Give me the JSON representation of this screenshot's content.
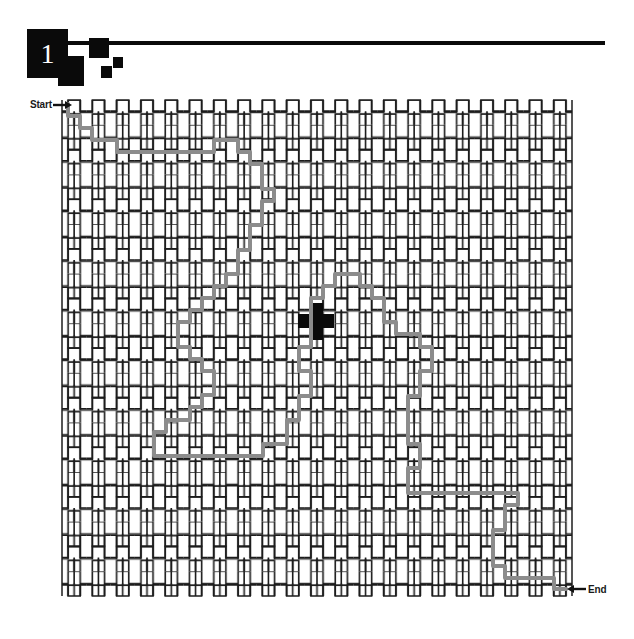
{
  "page": {
    "background_color": "#ffffff",
    "width": 634,
    "height": 639
  },
  "header": {
    "number": "1",
    "ink_color": "#0a0a0a",
    "rule_color": "#0a0a0a",
    "number_color": "#ffffff"
  },
  "maze": {
    "start_label": "Start",
    "end_label": "End",
    "wall_color": "#1c1c1c",
    "path_color": "#8c8c8c",
    "marker_color": "#0a0a0a",
    "marker_shape": "cross",
    "bounds": {
      "x": 62,
      "y": 100,
      "width": 510,
      "height": 496
    },
    "cell_pitch": 24.3,
    "columns": 21,
    "rows": 20,
    "start_point": {
      "x": 68,
      "y": 107
    },
    "end_point": {
      "x": 566,
      "y": 589
    },
    "marker_point": {
      "x": 316,
      "y": 321
    }
  },
  "icons": {
    "start_arrow": "arrow-right-icon",
    "end_arrow": "arrow-left-icon",
    "center_marker": "cross-marker-icon"
  },
  "solution_path": {
    "stroke_width": 4,
    "points": [
      [
        68,
        104
      ],
      [
        68,
        116
      ],
      [
        80,
        116
      ],
      [
        80,
        128
      ],
      [
        92,
        128
      ],
      [
        92,
        140
      ],
      [
        117,
        140
      ],
      [
        117,
        152
      ],
      [
        214,
        152
      ],
      [
        214,
        140
      ],
      [
        238,
        140
      ],
      [
        238,
        152
      ],
      [
        250,
        152
      ],
      [
        250,
        164
      ],
      [
        262,
        164
      ],
      [
        262,
        189
      ],
      [
        274,
        189
      ],
      [
        274,
        201
      ],
      [
        262,
        201
      ],
      [
        262,
        225
      ],
      [
        250,
        225
      ],
      [
        250,
        250
      ],
      [
        238,
        250
      ],
      [
        238,
        274
      ],
      [
        226,
        274
      ],
      [
        226,
        286
      ],
      [
        214,
        286
      ],
      [
        214,
        298
      ],
      [
        202,
        298
      ],
      [
        202,
        310
      ],
      [
        190,
        310
      ],
      [
        190,
        322
      ],
      [
        178,
        322
      ],
      [
        178,
        347
      ],
      [
        190,
        347
      ],
      [
        190,
        359
      ],
      [
        202,
        359
      ],
      [
        202,
        371
      ],
      [
        214,
        371
      ],
      [
        214,
        395
      ],
      [
        202,
        395
      ],
      [
        202,
        407
      ],
      [
        190,
        407
      ],
      [
        190,
        420
      ],
      [
        166,
        420
      ],
      [
        166,
        432
      ],
      [
        154,
        432
      ],
      [
        154,
        456
      ],
      [
        263,
        456
      ],
      [
        263,
        444
      ],
      [
        287,
        444
      ],
      [
        287,
        420
      ],
      [
        299,
        420
      ],
      [
        299,
        396
      ],
      [
        311,
        396
      ],
      [
        311,
        371
      ],
      [
        299,
        371
      ],
      [
        299,
        347
      ],
      [
        311,
        347
      ],
      [
        311,
        322
      ],
      [
        311,
        298
      ],
      [
        323,
        298
      ],
      [
        323,
        286
      ],
      [
        335,
        286
      ],
      [
        335,
        274
      ],
      [
        360,
        274
      ],
      [
        360,
        286
      ],
      [
        372,
        286
      ],
      [
        372,
        298
      ],
      [
        384,
        298
      ],
      [
        384,
        322
      ],
      [
        396,
        322
      ],
      [
        396,
        334
      ],
      [
        420,
        334
      ],
      [
        420,
        347
      ],
      [
        432,
        347
      ],
      [
        432,
        371
      ],
      [
        420,
        371
      ],
      [
        420,
        396
      ],
      [
        408,
        396
      ],
      [
        408,
        444
      ],
      [
        420,
        444
      ],
      [
        420,
        468
      ],
      [
        408,
        468
      ],
      [
        408,
        493
      ],
      [
        518,
        493
      ],
      [
        518,
        505
      ],
      [
        505,
        505
      ],
      [
        505,
        530
      ],
      [
        493,
        530
      ],
      [
        493,
        566
      ],
      [
        505,
        566
      ],
      [
        505,
        578
      ],
      [
        554,
        578
      ],
      [
        554,
        589
      ],
      [
        566,
        589
      ]
    ]
  }
}
